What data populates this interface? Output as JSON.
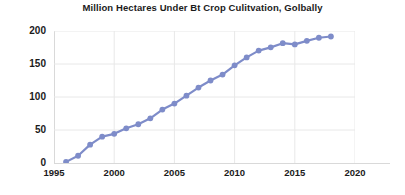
{
  "chart_data": {
    "type": "line",
    "title": "Million Hectares Under Bt Crop Culitvation, Golbally",
    "xlabel": "",
    "ylabel": "",
    "x": [
      1996,
      1997,
      1998,
      1999,
      2000,
      2001,
      2002,
      2003,
      2004,
      2005,
      2006,
      2007,
      2008,
      2009,
      2010,
      2011,
      2012,
      2013,
      2014,
      2015,
      2016,
      2017,
      2018
    ],
    "values": [
      1.7,
      11.0,
      27.8,
      39.9,
      44.2,
      52.6,
      58.7,
      67.7,
      81.0,
      90.0,
      102.0,
      114.3,
      125.0,
      134.0,
      148.0,
      160.0,
      170.3,
      175.2,
      181.5,
      179.7,
      185.1,
      189.8,
      191.7
    ],
    "series": [
      {
        "name": "Million hectares",
        "color": "#7e8cc9",
        "values": [
          1.7,
          11.0,
          27.8,
          39.9,
          44.2,
          52.6,
          58.7,
          67.7,
          81.0,
          90.0,
          102.0,
          114.3,
          125.0,
          134.0,
          148.0,
          160.0,
          170.3,
          175.2,
          181.5,
          179.7,
          185.1,
          189.8,
          191.7
        ]
      }
    ],
    "xlim": [
      1995,
      2020
    ],
    "ylim": [
      0,
      200
    ],
    "yticks": [
      0,
      50,
      100,
      150,
      200
    ],
    "ytick_labels": [
      "0",
      "50",
      "100",
      "150",
      "200"
    ],
    "xticks": [
      1995,
      2000,
      2005,
      2010,
      2015,
      2020
    ],
    "xtick_labels": [
      "1995",
      "2000",
      "2005",
      "2010",
      "2015",
      "2020"
    ],
    "grid": true,
    "grid_color": "#e8e8e8",
    "legend": false,
    "marker": "circle",
    "marker_size": 4,
    "line_width": 2.2,
    "background": "#ffffff"
  }
}
